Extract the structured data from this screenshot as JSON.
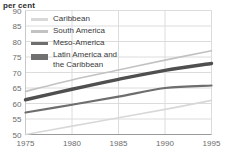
{
  "chart_data": {
    "type": "line",
    "title": "per cent",
    "xlabel": "",
    "ylabel": "per cent",
    "x": [
      1975,
      1980,
      1985,
      1990,
      1995
    ],
    "xlim": [
      1975,
      1995
    ],
    "ylim": [
      50,
      90
    ],
    "xticks": [
      "1975",
      "1980",
      "1985",
      "1990",
      "1995"
    ],
    "yticks": [
      "50",
      "55",
      "60",
      "65",
      "70",
      "75",
      "80",
      "85",
      "90"
    ],
    "grid": true,
    "legend_position": "upper-left-inside",
    "series": [
      {
        "name": "Caribbean",
        "color": "#d8d8d8",
        "width": 1.6,
        "values": [
          50.0,
          52.7,
          55.4,
          58.1,
          61.0
        ]
      },
      {
        "name": "South America",
        "color": "#c2c2c2",
        "width": 1.6,
        "values": [
          63.9,
          67.6,
          70.8,
          74.0,
          77.0
        ]
      },
      {
        "name": "Meso-America",
        "color": "#6e6e6e",
        "width": 2.2,
        "values": [
          57.1,
          59.6,
          62.2,
          65.0,
          65.8
        ]
      },
      {
        "name": "Latin America and\nthe Caribbean",
        "color": "#4f4f4f",
        "width": 3.4,
        "values": [
          61.2,
          64.6,
          67.8,
          70.7,
          72.9
        ]
      }
    ]
  },
  "legend": {
    "items": [
      {
        "label": "Caribbean",
        "color": "#d8d8d8",
        "thickness": 3
      },
      {
        "label": "South America",
        "color": "#c2c2c2",
        "thickness": 3
      },
      {
        "label": "Meso-America",
        "color": "#6e6e6e",
        "thickness": 3
      },
      {
        "label": "Latin America and\nthe Caribbean",
        "color": "#707070",
        "thickness": 6
      }
    ]
  },
  "axes": {
    "grid_color": "#dcdcdc",
    "frame_color": "#c8c8c8",
    "tick_color": "#6b6b6b"
  }
}
